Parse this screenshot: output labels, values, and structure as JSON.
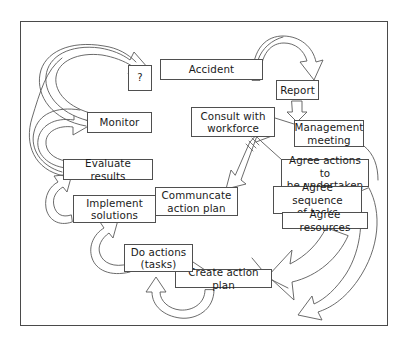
{
  "diagram": {
    "frame": {
      "border_color": "#4a4a4a",
      "background": "#ffffff"
    },
    "node_style": {
      "border_color": "#4f4f4f",
      "text_color": "#1a1a1a",
      "fill": "#ffffff"
    },
    "arrow_style": {
      "stroke": "#555555",
      "fill": "#ffffff"
    }
  },
  "nodes": {
    "accident": {
      "label": "Accident",
      "x": 160,
      "y": 59,
      "w": 103,
      "h": 21
    },
    "report": {
      "label": "Report",
      "x": 276,
      "y": 80,
      "w": 43,
      "h": 20
    },
    "management_meeting": {
      "label": "Management\nmeeting",
      "x": 294,
      "y": 120,
      "w": 70,
      "h": 27
    },
    "consult_workforce": {
      "label": "Consult with\nworkforce",
      "x": 191,
      "y": 107,
      "w": 84,
      "h": 30
    },
    "agree_actions": {
      "label": "Agree actions to\nbe undertaken",
      "x": 281,
      "y": 159,
      "w": 88,
      "h": 28
    },
    "agree_sequence": {
      "label": "Agree sequence\nof tasks",
      "x": 273,
      "y": 186,
      "w": 89,
      "h": 28
    },
    "agree_resources": {
      "label": "Agree resources",
      "x": 282,
      "y": 212,
      "w": 86,
      "h": 17
    },
    "communicate_plan": {
      "label": "Communcate\naction plan",
      "x": 155,
      "y": 187,
      "w": 83,
      "h": 29
    },
    "create_plan": {
      "label": "Create action plan",
      "x": 175,
      "y": 269,
      "w": 97,
      "h": 19
    },
    "do_actions": {
      "label": "Do actions\n(tasks)",
      "x": 124,
      "y": 244,
      "w": 69,
      "h": 28
    },
    "implement_solutions": {
      "label": "Implement\nsolutions",
      "x": 73,
      "y": 195,
      "w": 83,
      "h": 28
    },
    "evaluate_results": {
      "label": "Evaluate results",
      "x": 63,
      "y": 159,
      "w": 90,
      "h": 21
    },
    "monitor": {
      "label": "Monitor",
      "x": 87,
      "y": 112,
      "w": 65,
      "h": 21
    },
    "question": {
      "label": "?",
      "x": 128,
      "y": 65,
      "w": 24,
      "h": 26
    }
  },
  "flow_sequence": [
    "Accident",
    "Report",
    "Management meeting",
    "Agree actions to be undertaken",
    "Agree sequence of tasks",
    "Agree resources",
    "Create action plan",
    "Do actions (tasks)",
    "Communcate action plan",
    "Implement solutions",
    "Evaluate results",
    "Monitor",
    "?"
  ],
  "arrows": [
    {
      "name": "accident-to-report",
      "type": "curved-block-arrow",
      "direction": "right-down"
    },
    {
      "name": "report-to-management-meeting",
      "type": "straight-block-arrow",
      "direction": "down"
    },
    {
      "name": "management-to-communicate",
      "type": "hatched-block-arrow",
      "direction": "down-left"
    },
    {
      "name": "agree-to-create-plan",
      "type": "large-curved-block-arrow",
      "direction": "left"
    },
    {
      "name": "create-plan-to-do-actions",
      "type": "curved-block-arrow",
      "direction": "up-left"
    },
    {
      "name": "do-actions-to-implement",
      "type": "curved-block-arrow",
      "direction": "up-left"
    },
    {
      "name": "evaluate-to-monitor",
      "type": "curved-block-arrow",
      "direction": "up-right"
    },
    {
      "name": "monitor-to-question",
      "type": "curved-block-arrow",
      "direction": "up-right"
    }
  ]
}
